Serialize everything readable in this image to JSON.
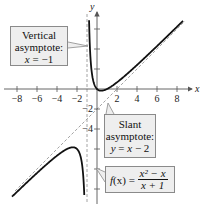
{
  "chart_data": {
    "type": "line",
    "title": "",
    "function": "f(x) = (x^2 - x)/(x + 1)",
    "xlabel": "x",
    "ylabel": "y",
    "xlim": [
      -9.5,
      10
    ],
    "ylim": [
      -10.7,
      8
    ],
    "x_ticks": [
      -8,
      -6,
      -4,
      -2,
      2,
      4,
      6,
      8
    ],
    "x_tick_labels": [
      "−8",
      "−6",
      "−4",
      "−2",
      "2",
      "4",
      "6",
      "8"
    ],
    "y_ticks": [
      6,
      4,
      2,
      -2,
      -4,
      -6,
      -8,
      -10
    ],
    "y_tick_labels_shown": [
      "−2",
      "−4"
    ],
    "grid": false,
    "series": [
      {
        "name": "f(x) right branch",
        "x_range": [
          -0.92,
          8.6
        ],
        "style": "solid"
      },
      {
        "name": "f(x) left branch",
        "x_range": [
          -8.5,
          -1.1
        ],
        "style": "solid"
      },
      {
        "name": "Slant asymptote y = x − 2",
        "style": "dashed"
      },
      {
        "name": "Vertical asymptote x = −1",
        "style": "dashed"
      }
    ],
    "annotations": [
      {
        "lines": [
          "Vertical",
          "asymptote:",
          "x = −1"
        ]
      },
      {
        "lines": [
          "Slant",
          "asymptote:",
          "y = x − 2"
        ]
      },
      {
        "lines": [
          "f(x) = (x² − x)/(x + 1)"
        ]
      }
    ]
  },
  "labels": {
    "x_axis": "x",
    "y_axis": "y",
    "vertical_callout": {
      "line1": "Vertical",
      "line2": "asymptote:",
      "line3_var": "x",
      "line3_rest": " = −1"
    },
    "slant_callout": {
      "line1": "Slant",
      "line2": "asymptote:",
      "line3_var_y": "y",
      "line3_eq": " = ",
      "line3_var_x": "x",
      "line3_rest": " − 2"
    },
    "function_callout": {
      "f": "f",
      "x": "(x)",
      "eq": " = ",
      "num": "x² − x",
      "den": "x + 1"
    }
  },
  "colors": {
    "curve": "#111111",
    "asymptote": "#9a9a9a",
    "axis": "#555555",
    "callout_bg": "#eeeeee",
    "callout_border": "#8a8a8a"
  }
}
